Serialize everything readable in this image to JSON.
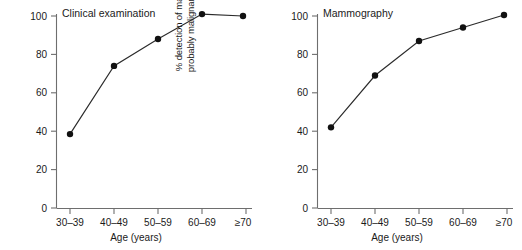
{
  "figure": {
    "panel_count": 2,
    "background_color": "#ffffff",
    "line_color": "#2b2b2b",
    "marker_color": "#111111",
    "axis_color": "#6e6e6e"
  },
  "axes": {
    "ylabel_line1": "% detection of malignant or",
    "ylabel_line2": "probably malignant lessions",
    "xlabel": "Age (years)",
    "ytick_labels": [
      "0",
      "20",
      "40",
      "60",
      "80",
      "100"
    ],
    "xtick_labels": [
      "30–39",
      "40–49",
      "50–59",
      "60–69",
      "≥70"
    ]
  },
  "chart_data": [
    {
      "type": "line",
      "title": "Clinical examination",
      "xlabel": "Age (years)",
      "ylabel": "% detection of malignant or probably malignant lessions",
      "categories": [
        "30–39",
        "40–49",
        "50–59",
        "60–69",
        "≥70"
      ],
      "values": [
        38.5,
        74,
        88,
        101,
        100
      ],
      "ylim": [
        0,
        100
      ],
      "yticks": [
        0,
        20,
        40,
        60,
        80,
        100
      ],
      "grid": false,
      "legend": null,
      "markers": "filled-circle"
    },
    {
      "type": "line",
      "title": "Mammography",
      "xlabel": "Age (years)",
      "ylabel": "% detection of malignant or probably malignant lessions",
      "categories": [
        "30–39",
        "40–49",
        "50–59",
        "60–69",
        "≥70"
      ],
      "values": [
        42,
        69,
        87,
        94,
        100.5
      ],
      "ylim": [
        0,
        100
      ],
      "yticks": [
        0,
        20,
        40,
        60,
        80,
        100
      ],
      "grid": false,
      "legend": null,
      "markers": "filled-circle"
    }
  ]
}
